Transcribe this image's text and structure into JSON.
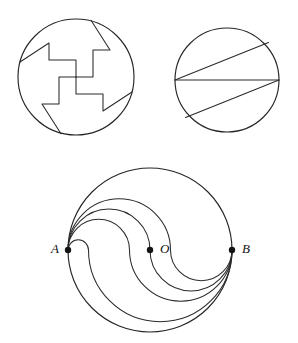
{
  "page": {
    "background_color": "#ffffff",
    "stroke_color": "#262626",
    "width": 298,
    "height": 343
  },
  "figures": [
    {
      "id": "figure-1",
      "name": "pinwheel-circle",
      "description": "Circle divided into four congruent pinwheel (swastika-shaped) regions",
      "center": {
        "x": 76,
        "y": 77
      },
      "radius": 58,
      "parts": 4
    },
    {
      "id": "figure-2",
      "name": "chorded-circle",
      "description": "Circle divided by a horizontal diameter and two slanted chords",
      "center": {
        "x": 227,
        "y": 80
      },
      "radius": 52,
      "parts": 4
    },
    {
      "id": "figure-3",
      "name": "s-curve-circle",
      "description": "Circle divided by nested S-shaped semicircular curves through A, O and B",
      "center": {
        "x": 150,
        "y": 250
      },
      "radius": 82,
      "parts": 5
    }
  ],
  "points": {
    "a": {
      "label": "A",
      "x": 68,
      "y": 250
    },
    "o": {
      "label": "O",
      "x": 150,
      "y": 250
    },
    "b": {
      "label": "B",
      "x": 232,
      "y": 250
    }
  },
  "labels": {
    "a": "A",
    "o": "O",
    "b": "B"
  }
}
